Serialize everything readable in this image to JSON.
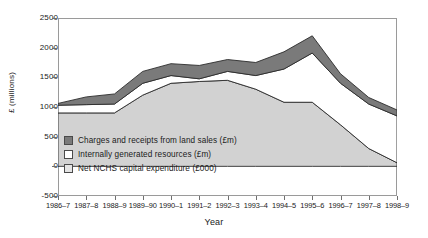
{
  "chart_data": {
    "type": "area",
    "stacked": true,
    "title": "",
    "xlabel": "Year",
    "ylabel": "£ (millions)",
    "ylim": [
      -500,
      2500
    ],
    "yticks": [
      2500,
      2000,
      1500,
      1000,
      500,
      0,
      -500
    ],
    "grid": false,
    "legend_position": "inside-lower-left",
    "categories": [
      "1986–7",
      "1987–8",
      "1988–9",
      "1989–90",
      "1990–1",
      "1991–2",
      "1992–3",
      "1993–4",
      "1994–5",
      "1995–6",
      "1996–7",
      "1997–8",
      "1998–9"
    ],
    "series": [
      {
        "name": "Net NCHS capital expenditure (£000)",
        "color": "#d2d2d2",
        "order": "bottom",
        "values": [
          900,
          900,
          900,
          1200,
          1400,
          1430,
          1450,
          1300,
          1080,
          1080,
          700,
          300,
          60
        ]
      },
      {
        "name": "Internally generated resources (£m)",
        "color": "#ffffff",
        "order": "middle",
        "values": [
          130,
          140,
          150,
          200,
          130,
          45,
          150,
          230,
          560,
          830,
          700,
          750,
          790
        ]
      },
      {
        "name": "Charges and receipts from land sales (£m)",
        "color": "#7a7a7a",
        "order": "top",
        "values": [
          30,
          130,
          170,
          200,
          200,
          225,
          200,
          220,
          290,
          290,
          160,
          110,
          100
        ]
      }
    ],
    "cumulative_top_edge": [
      1060,
      1170,
      1220,
      1600,
      1730,
      1700,
      1800,
      1750,
      1930,
      2200,
      1560,
      1160,
      950
    ],
    "axis_color": "#9a9a9a"
  },
  "legend": {
    "items": [
      {
        "label": "Charges and receipts from land sales (£m)",
        "swatch": "#7a7a7a"
      },
      {
        "label": "Internally generated resources (£m)",
        "swatch": "#ffffff"
      },
      {
        "label": "Net NCHS capital expenditure (£000)",
        "swatch": "#e4e4e4"
      }
    ]
  }
}
